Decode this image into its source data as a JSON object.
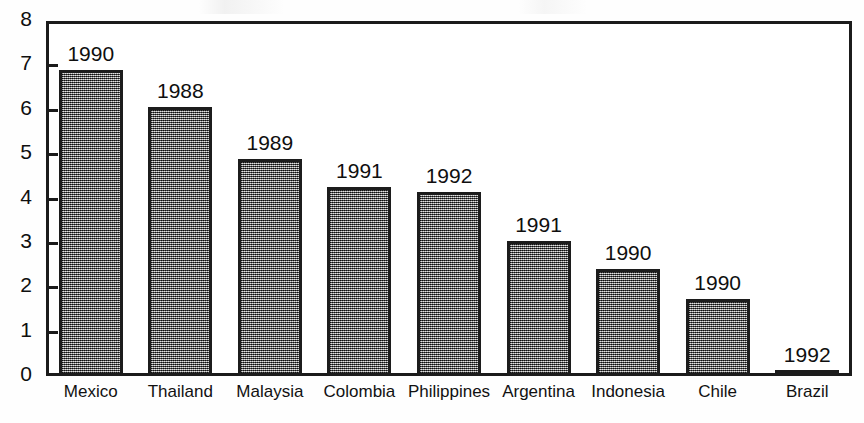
{
  "chart_data": {
    "type": "bar",
    "title": "",
    "subtitle": "",
    "xlabel": "",
    "ylabel": "",
    "ylim": [
      0,
      8
    ],
    "ytick_labels": [
      "0",
      "1",
      "2",
      "3",
      "4",
      "5",
      "6",
      "7",
      "8"
    ],
    "ytick_values": [
      0,
      1,
      2,
      3,
      4,
      5,
      6,
      7,
      8
    ],
    "grid": false,
    "legend": "none",
    "categories": [
      "Mexico",
      "Thailand",
      "Malaysia",
      "Colombia",
      "Philippines",
      "Argentina",
      "Indonesia",
      "Chile",
      "Brazil"
    ],
    "values": [
      6.9,
      6.07,
      4.9,
      4.27,
      4.15,
      3.05,
      2.42,
      1.73,
      0.12
    ],
    "point_labels": [
      "1990",
      "1988",
      "1989",
      "1991",
      "1992",
      "1991",
      "1990",
      "1990",
      "1992"
    ],
    "series": [
      {
        "name": "value",
        "values": [
          6.9,
          6.07,
          4.9,
          4.27,
          4.15,
          3.05,
          2.42,
          1.73,
          0.12
        ]
      }
    ],
    "bar_fill": "#6f6f6f",
    "bar_edge": "#1c1c1c",
    "axis_color": "#1b1b1b"
  }
}
